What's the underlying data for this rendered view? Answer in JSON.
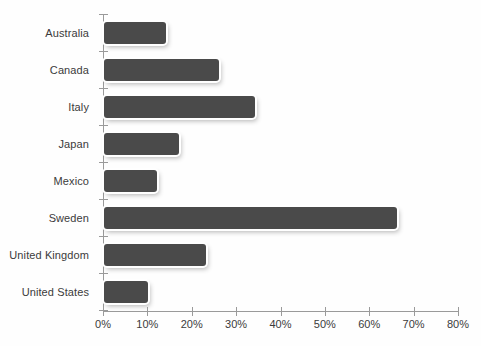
{
  "chart_data": {
    "type": "bar",
    "orientation": "horizontal",
    "title": "",
    "subtitle": "",
    "xlabel": "",
    "ylabel": "",
    "categories": [
      "Australia",
      "Canada",
      "Italy",
      "Japan",
      "Mexico",
      "Sweden",
      "United Kingdom",
      "United States"
    ],
    "values": [
      14,
      26,
      34,
      17,
      12,
      66,
      23,
      10
    ],
    "value_unit": "%",
    "xlim": [
      0,
      80
    ],
    "xticks": [
      0,
      10,
      20,
      30,
      40,
      50,
      60,
      70,
      80
    ],
    "xtick_labels": [
      "0%",
      "10%",
      "20%",
      "30%",
      "40%",
      "50%",
      "60%",
      "70%",
      "80%"
    ],
    "grid": false,
    "legend": false,
    "legend_position": "none",
    "series": [
      {
        "name": "",
        "values": [
          14,
          26,
          34,
          17,
          12,
          66,
          23,
          10
        ]
      }
    ]
  },
  "style": {
    "bar_color": "#4a4a4a",
    "axis_color": "#9a9a9a",
    "text_color": "#3b3b3b",
    "background": "#fefefe"
  }
}
